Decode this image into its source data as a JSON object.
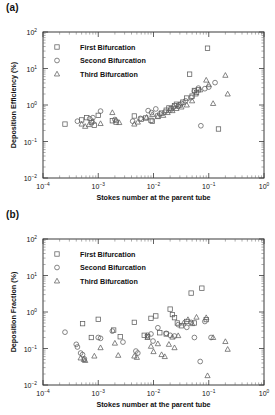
{
  "figure": {
    "panels": [
      {
        "id": "a",
        "label": "(a)",
        "ylabel": "Deposition Efficiency (%)",
        "xlabel": "Stokes number at the parent tube"
      },
      {
        "id": "b",
        "label": "(b)",
        "ylabel": "Deposition Fraction (%)",
        "xlabel": "Stokes number at the parent tube"
      }
    ],
    "legend": {
      "entries": [
        {
          "marker": "square",
          "label": "First Bifurcation"
        },
        {
          "marker": "circle",
          "label": "Second Bifurcation"
        },
        {
          "marker": "triangle",
          "label": "Third Bifurcation"
        }
      ]
    },
    "axis_tick_labels": {
      "x": [
        "10-4",
        "10-3",
        "10-2",
        "10-1",
        "100"
      ],
      "y": [
        "10-2",
        "10-1",
        "100",
        "101",
        "102"
      ]
    },
    "colors": {
      "marker_stroke": "#5d5d5d",
      "axis": "#3a3a3a",
      "text": "#111111",
      "background": "#ffffff"
    }
  },
  "chart_data": [
    {
      "type": "scatter",
      "panel": "a",
      "title": "",
      "xlabel": "Stokes number at the parent tube",
      "ylabel": "Deposition Efficiency (%)",
      "xscale": "log",
      "yscale": "log",
      "xlim": [
        0.0001,
        1
      ],
      "ylim": [
        0.01,
        100
      ],
      "grid": false,
      "legend_position": "upper-left-inside",
      "series": [
        {
          "name": "First Bifurcation",
          "marker": "square",
          "points": [
            [
              0.00025,
              0.3
            ],
            [
              0.0005,
              0.39
            ],
            [
              0.00062,
              0.45
            ],
            [
              0.00075,
              0.33
            ],
            [
              0.00085,
              0.28
            ],
            [
              0.001,
              0.52
            ],
            [
              0.0018,
              0.37
            ],
            [
              0.0021,
              0.34
            ],
            [
              0.0045,
              0.5
            ],
            [
              0.006,
              0.41
            ],
            [
              0.0072,
              0.44
            ],
            [
              0.009,
              0.38
            ],
            [
              0.0095,
              0.36
            ],
            [
              0.012,
              0.5
            ],
            [
              0.014,
              0.6
            ],
            [
              0.017,
              0.72
            ],
            [
              0.019,
              0.83
            ],
            [
              0.021,
              0.8
            ],
            [
              0.024,
              0.95
            ],
            [
              0.026,
              1.05
            ],
            [
              0.03,
              1.0
            ],
            [
              0.034,
              1.2
            ],
            [
              0.04,
              1.55
            ],
            [
              0.045,
              7.0
            ],
            [
              0.05,
              1.75
            ],
            [
              0.055,
              2.5
            ],
            [
              0.06,
              2.2
            ],
            [
              0.065,
              2.6
            ],
            [
              0.095,
              36.0
            ],
            [
              0.15,
              0.22
            ]
          ]
        },
        {
          "name": "Second Bifurcation",
          "marker": "circle",
          "points": [
            [
              0.00042,
              0.36
            ],
            [
              0.0007,
              0.42
            ],
            [
              0.0008,
              0.45
            ],
            [
              0.0011,
              0.68
            ],
            [
              0.002,
              0.4
            ],
            [
              0.0042,
              0.36
            ],
            [
              0.0058,
              0.43
            ],
            [
              0.008,
              0.7
            ],
            [
              0.0092,
              0.62
            ],
            [
              0.011,
              0.78
            ],
            [
              0.013,
              0.57
            ],
            [
              0.016,
              0.64
            ],
            [
              0.02,
              0.72
            ],
            [
              0.023,
              0.88
            ],
            [
              0.028,
              0.92
            ],
            [
              0.032,
              1.1
            ],
            [
              0.038,
              1.3
            ],
            [
              0.048,
              1.6
            ],
            [
              0.055,
              2.4
            ],
            [
              0.065,
              2.9
            ],
            [
              0.072,
              0.27
            ],
            [
              0.085,
              2.8
            ],
            [
              0.1,
              3.1
            ],
            [
              0.13,
              4.1
            ]
          ]
        },
        {
          "name": "Third Bifurcation",
          "marker": "triangle",
          "points": [
            [
              0.0005,
              0.3
            ],
            [
              0.00058,
              0.26
            ],
            [
              0.00068,
              0.29
            ],
            [
              0.0008,
              0.36
            ],
            [
              0.0011,
              0.31
            ],
            [
              0.0018,
              0.62
            ],
            [
              0.0021,
              0.38
            ],
            [
              0.0024,
              0.33
            ],
            [
              0.0045,
              0.3
            ],
            [
              0.0052,
              0.34
            ],
            [
              0.0075,
              0.46
            ],
            [
              0.0095,
              0.55
            ],
            [
              0.012,
              0.48
            ],
            [
              0.015,
              0.52
            ],
            [
              0.018,
              0.62
            ],
            [
              0.022,
              0.7
            ],
            [
              0.026,
              0.8
            ],
            [
              0.032,
              0.88
            ],
            [
              0.04,
              1.0
            ],
            [
              0.05,
              1.3
            ],
            [
              0.058,
              2.0
            ],
            [
              0.07,
              2.6
            ],
            [
              0.09,
              4.8
            ],
            [
              0.1,
              3.6
            ],
            [
              0.12,
              1.1
            ],
            [
              0.2,
              6.5
            ],
            [
              0.22,
              2.0
            ]
          ]
        }
      ]
    },
    {
      "type": "scatter",
      "panel": "b",
      "title": "",
      "xlabel": "Stokes number at the parent tube",
      "ylabel": "Deposition Fraction (%)",
      "xscale": "log",
      "yscale": "log",
      "xlim": [
        0.0001,
        1
      ],
      "ylim": [
        0.01,
        100
      ],
      "grid": false,
      "legend_position": "upper-left-inside",
      "series": [
        {
          "name": "First Bifurcation",
          "marker": "square",
          "points": [
            [
              0.00052,
              0.48
            ],
            [
              0.00075,
              0.2
            ],
            [
              0.001,
              0.63
            ],
            [
              0.0019,
              0.32
            ],
            [
              0.0025,
              0.21
            ],
            [
              0.0045,
              0.52
            ],
            [
              0.0068,
              0.23
            ],
            [
              0.0078,
              0.21
            ],
            [
              0.009,
              0.67
            ],
            [
              0.011,
              0.78
            ],
            [
              0.013,
              0.27
            ],
            [
              0.017,
              0.25
            ],
            [
              0.02,
              1.2
            ],
            [
              0.022,
              0.85
            ],
            [
              0.024,
              0.7
            ],
            [
              0.027,
              0.5
            ],
            [
              0.032,
              0.42
            ],
            [
              0.04,
              0.55
            ],
            [
              0.048,
              3.3
            ],
            [
              0.055,
              0.5
            ],
            [
              0.075,
              4.5
            ],
            [
              0.09,
              0.62
            ]
          ]
        },
        {
          "name": "Second Bifurcation",
          "marker": "circle",
          "points": [
            [
              0.00025,
              0.28
            ],
            [
              0.0004,
              0.13
            ],
            [
              0.00042,
              0.11
            ],
            [
              0.00048,
              0.075
            ],
            [
              0.00052,
              0.068
            ],
            [
              0.00056,
              0.052
            ],
            [
              0.001,
              0.2
            ],
            [
              0.0011,
              0.19
            ],
            [
              0.0018,
              0.3
            ],
            [
              0.0028,
              0.15
            ],
            [
              0.0048,
              0.085
            ],
            [
              0.0052,
              0.075
            ],
            [
              0.0078,
              0.23
            ],
            [
              0.009,
              0.25
            ],
            [
              0.0098,
              0.16
            ],
            [
              0.012,
              0.37
            ],
            [
              0.017,
              0.26
            ],
            [
              0.02,
              0.23
            ],
            [
              0.024,
              0.22
            ],
            [
              0.028,
              0.45
            ],
            [
              0.04,
              0.38
            ],
            [
              0.048,
              0.52
            ],
            [
              0.055,
              0.2
            ],
            [
              0.07,
              0.044
            ],
            [
              0.085,
              0.55
            ],
            [
              0.11,
              0.2
            ]
          ]
        },
        {
          "name": "Third Bifurcation",
          "marker": "triangle",
          "points": [
            [
              0.00048,
              0.055
            ],
            [
              0.00055,
              0.05
            ],
            [
              0.00058,
              0.047
            ],
            [
              0.00085,
              0.062
            ],
            [
              0.0011,
              0.105
            ],
            [
              0.002,
              0.14
            ],
            [
              0.0023,
              0.065
            ],
            [
              0.0045,
              0.062
            ],
            [
              0.005,
              0.057
            ],
            [
              0.0078,
              0.2
            ],
            [
              0.009,
              0.115
            ],
            [
              0.01,
              0.082
            ],
            [
              0.012,
              0.135
            ],
            [
              0.014,
              0.068
            ],
            [
              0.016,
              0.06
            ],
            [
              0.019,
              0.13
            ],
            [
              0.022,
              0.205
            ],
            [
              0.024,
              0.105
            ],
            [
              0.028,
              0.225
            ],
            [
              0.035,
              0.5
            ],
            [
              0.042,
              0.62
            ],
            [
              0.05,
              0.48
            ],
            [
              0.06,
              0.72
            ],
            [
              0.09,
              0.7
            ],
            [
              0.095,
              0.018
            ],
            [
              0.12,
              0.2
            ],
            [
              0.2,
              0.155
            ],
            [
              0.22,
              0.095
            ]
          ]
        }
      ]
    }
  ]
}
